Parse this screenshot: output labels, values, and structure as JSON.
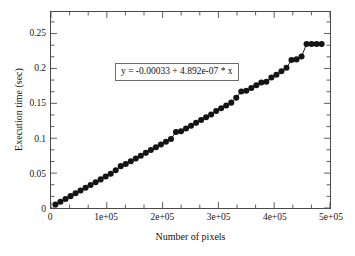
{
  "figure": {
    "background_color": "#ffffff",
    "frame_color": "#4a4a4a",
    "marker_color": "#141414",
    "line_color": "#141414"
  },
  "chart_data": {
    "type": "scatter",
    "title": "",
    "subtitle": "",
    "xlabel": "Number of pixels",
    "ylabel": "Execution time (sec)",
    "xlim": [
      0,
      500000
    ],
    "ylim": [
      0,
      0.2809
    ],
    "grid": false,
    "legend": null,
    "legend_position": "none",
    "marker": "filled-circle",
    "connected": true,
    "xticks": [
      0,
      100000,
      200000,
      300000,
      400000,
      500000
    ],
    "xtick_labels": [
      "0",
      "1e+05",
      "2e+05",
      "3e+05",
      "4e+05",
      "5e+05"
    ],
    "x_minor_ticks_per_interval": 2,
    "yticks": [
      0,
      0.05,
      0.1,
      0.15,
      0.2,
      0.25
    ],
    "ytick_labels": [
      "0",
      "0.05",
      "0.1",
      "0.15",
      "0.2",
      "0.25"
    ],
    "y_minor_ticks_per_interval": 2,
    "annotations": [
      {
        "name": "fit-equation",
        "text": "y = -0.00033 + 4.892e-07 * x",
        "boxed": true
      }
    ],
    "fit": {
      "intercept": -0.00033,
      "slope": 4.892e-07,
      "equation": "y = -0.00033 + 4.892e-07 * x"
    },
    "x": [
      8000,
      17000,
      26000,
      35000,
      44000,
      53000,
      62000,
      71000,
      80000,
      89000,
      98000,
      107000,
      116000,
      125000,
      134000,
      143000,
      152000,
      161000,
      170000,
      179000,
      188000,
      197000,
      206000,
      215000,
      224000,
      233000,
      242000,
      251000,
      260000,
      269000,
      278000,
      287000,
      296000,
      305000,
      314000,
      323000,
      332000,
      341000,
      350000,
      359000,
      368000,
      377000,
      386000,
      395000,
      404000,
      413000,
      422000,
      431000,
      440000,
      449000,
      458000,
      467000,
      476000,
      485000
    ],
    "y": [
      0.005,
      0.009,
      0.013,
      0.017,
      0.021,
      0.025,
      0.029,
      0.033,
      0.037,
      0.041,
      0.045,
      0.049,
      0.054,
      0.06,
      0.063,
      0.067,
      0.071,
      0.075,
      0.079,
      0.083,
      0.087,
      0.091,
      0.095,
      0.099,
      0.109,
      0.11,
      0.114,
      0.118,
      0.122,
      0.126,
      0.13,
      0.134,
      0.139,
      0.143,
      0.147,
      0.151,
      0.158,
      0.167,
      0.168,
      0.172,
      0.176,
      0.18,
      0.181,
      0.187,
      0.191,
      0.196,
      0.201,
      0.212,
      0.213,
      0.217,
      0.235,
      0.235,
      0.235,
      0.235
    ]
  }
}
